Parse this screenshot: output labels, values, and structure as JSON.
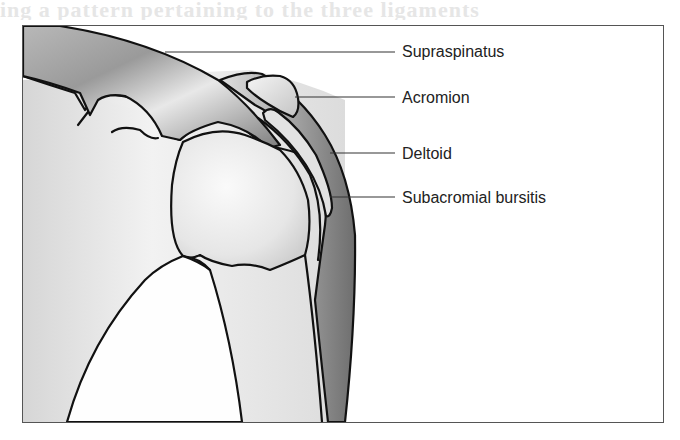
{
  "figure": {
    "type": "anatomical-illustration",
    "labels": [
      {
        "id": "supraspinatus",
        "text": "Supraspinatus",
        "x": 402,
        "y": 43
      },
      {
        "id": "acromion",
        "text": "Acromion",
        "x": 402,
        "y": 89
      },
      {
        "id": "deltoid",
        "text": "Deltoid",
        "x": 402,
        "y": 145
      },
      {
        "id": "subacromial-bursitis",
        "text": "Subacromial bursitis",
        "x": 402,
        "y": 189
      }
    ],
    "bleed_text": "ing a pattern pertaining to the three ligaments"
  }
}
